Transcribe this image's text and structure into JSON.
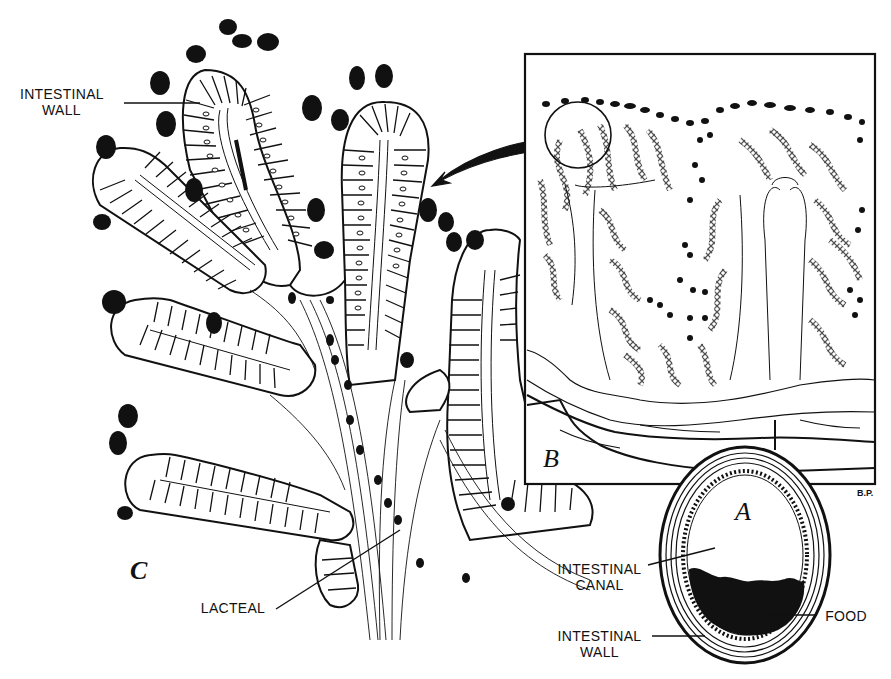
{
  "figure": {
    "panels": {
      "A": {
        "letter": "A",
        "title": "Cross-section of intestine"
      },
      "B": {
        "letter": "B",
        "title": "Section of intestinal wall (magnified)"
      },
      "C": {
        "letter": "C",
        "title": "Villi (highly magnified)"
      }
    },
    "labels": {
      "c_intestinal_wall_line1": "INTESTINAL",
      "c_intestinal_wall_line2": "WALL",
      "c_lacteal": "LACTEAL",
      "a_intestinal_canal_line1": "INTESTINAL",
      "a_intestinal_canal_line2": "CANAL",
      "a_food": "FOOD",
      "a_intestinal_wall_line1": "INTESTINAL",
      "a_intestinal_wall_line2": "WALL"
    },
    "signature": "B.P.",
    "colors": {
      "ink": "#111111",
      "paper": "#ffffff"
    }
  }
}
